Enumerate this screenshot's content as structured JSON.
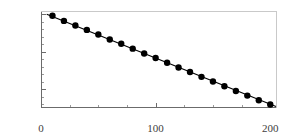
{
  "chart_data": {
    "type": "line",
    "title": "",
    "subtitle": "",
    "xlabel": "",
    "ylabel": "",
    "yscale": "log",
    "xscale": "linear",
    "grid": false,
    "legend": null,
    "xlim": [
      0,
      205
    ],
    "ylim_exponent": [
      -62,
      2
    ],
    "xticks": [
      0,
      100,
      200
    ],
    "xtick_labels": [
      "0",
      "100",
      "200"
    ],
    "xticks_minor": [
      25,
      50,
      75,
      125,
      150,
      175
    ],
    "yticks_exponent": [
      0,
      -25,
      -50
    ],
    "ytick_labels": [
      "1",
      "10-25",
      "10-50"
    ],
    "ytick_label_parts": [
      {
        "base": "1",
        "exp": ""
      },
      {
        "base": "10",
        "exp": "-25"
      },
      {
        "base": "10",
        "exp": "-50"
      }
    ],
    "yticks_minor_exponent": [
      -5,
      -10,
      -15,
      -20,
      -30,
      -35,
      -40,
      -45,
      -55,
      -60
    ],
    "series": [
      {
        "name": "fit-line",
        "style": "solid-line",
        "color": "#000000",
        "linewidth": 1.1,
        "x": [
          5,
          205
        ],
        "log10y": [
          -0.2,
          -61.6
        ]
      },
      {
        "name": "data-points",
        "style": "markers",
        "color": "#000000",
        "marker": "filled-circle",
        "marker_size": 3.2,
        "x": [
          10,
          20,
          30,
          40,
          50,
          60,
          70,
          80,
          90,
          100,
          110,
          120,
          130,
          140,
          150,
          160,
          170,
          180,
          190,
          200
        ],
        "log10y": [
          -1.2,
          -4.6,
          -7.7,
          -10.6,
          -13.7,
          -17.0,
          -19.8,
          -23.1,
          -26.3,
          -29.3,
          -32.5,
          -35.7,
          -38.7,
          -41.9,
          -45.0,
          -48.2,
          -51.3,
          -54.4,
          -57.5,
          -60.3
        ]
      }
    ],
    "colors": {
      "background": "#ffffff",
      "axis": "#6b6b6b",
      "axis_light": "#c9c9c9",
      "text": "#404040",
      "data": "#000000"
    }
  }
}
